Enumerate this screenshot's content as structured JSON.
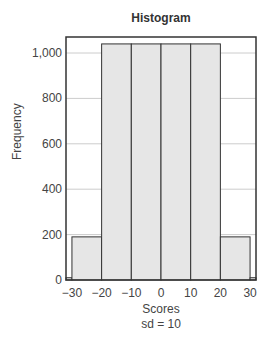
{
  "chart_data": {
    "type": "bar",
    "title": "Histogram",
    "xlabel": "Scores",
    "subtitle": "sd = 10",
    "ylabel": "Frequency",
    "categories": [
      "-32 to -30",
      "-30 to -20",
      "-20 to -10",
      "-10 to 0",
      "0 to 10",
      "10 to 20",
      "20 to 30",
      "30 to 32"
    ],
    "bin_edges": [
      -32,
      -30,
      -20,
      -10,
      0,
      10,
      20,
      30,
      32
    ],
    "values": [
      10,
      190,
      1040,
      1040,
      1040,
      1040,
      190,
      10
    ],
    "xlim": [
      -32,
      32
    ],
    "ylim": [
      0,
      1070
    ],
    "x_ticks": [
      "-30",
      "-20",
      "-10",
      "0",
      "10",
      "20",
      "30"
    ],
    "y_ticks": [
      "0",
      "200",
      "400",
      "600",
      "800",
      "1,000"
    ],
    "grid": "horizontal",
    "bar_color": "#e6e6e6",
    "edge_color": "#333333"
  }
}
